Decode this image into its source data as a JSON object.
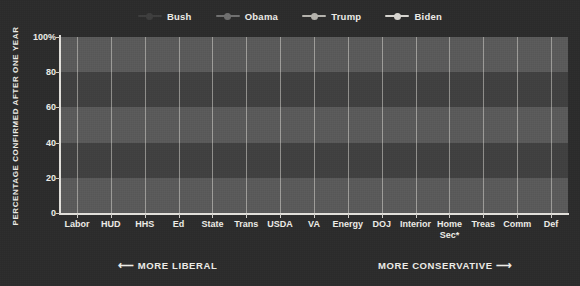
{
  "chart_data": {
    "type": "line",
    "title": "",
    "xlabel": "",
    "ylabel": "PERCENTAGE CONFIRMED AFTER ONE YEAR",
    "ylim": [
      0,
      100
    ],
    "yticks": [
      "0",
      "20",
      "40",
      "60",
      "80",
      "100%"
    ],
    "ytick_values": [
      0,
      20,
      40,
      60,
      80,
      100
    ],
    "grid": "horizontal-bands-and-vertical-lines",
    "legend_position": "top-center",
    "categories": [
      "Labor",
      "HUD",
      "HHS",
      "Ed",
      "State",
      "Trans",
      "USDA",
      "VA",
      "Energy",
      "DOJ",
      "Interior",
      "Home Sec*",
      "Treas",
      "Comm",
      "Def"
    ],
    "series": [
      {
        "name": "Bush",
        "color": "#3d3d3d",
        "values": [
          69,
          57,
          55,
          75,
          62,
          59,
          78,
          82,
          62,
          40,
          55,
          55,
          45,
          56,
          63
        ]
      },
      {
        "name": "Obama",
        "color": "#6f6f6f",
        "values": [
          44,
          60,
          44,
          50,
          45,
          70,
          94,
          63,
          43,
          46,
          82,
          69,
          45,
          88,
          94
        ]
      },
      {
        "name": "Trump",
        "color": "#b6b4ae",
        "values": [
          46,
          32,
          47,
          25,
          22,
          41,
          49,
          67,
          36,
          45,
          33,
          54,
          31,
          57,
          46
        ]
      },
      {
        "name": "Biden",
        "color": "#d9d7d1",
        "values": [
          29,
          31,
          45,
          25,
          22,
          28,
          28,
          43,
          63,
          21,
          55,
          55,
          43,
          44,
          53
        ]
      }
    ],
    "annotations": {
      "left": "MORE LIBERAL",
      "left_arrow": "⟵",
      "right": "MORE CONSERVATIVE",
      "right_arrow": "⟶"
    }
  },
  "legend": {
    "items": [
      {
        "label": "Bush",
        "color": "#3d3d3d"
      },
      {
        "label": "Obama",
        "color": "#6f6f6f"
      },
      {
        "label": "Trump",
        "color": "#b6b4ae"
      },
      {
        "label": "Biden",
        "color": "#d9d7d1"
      }
    ]
  },
  "theme": {
    "background": "#2b2b2b",
    "plot_background": "#595959",
    "band_dark": "#3f3f3f",
    "axis_color": "#e3e1dc",
    "text_color": "#efeee9"
  }
}
